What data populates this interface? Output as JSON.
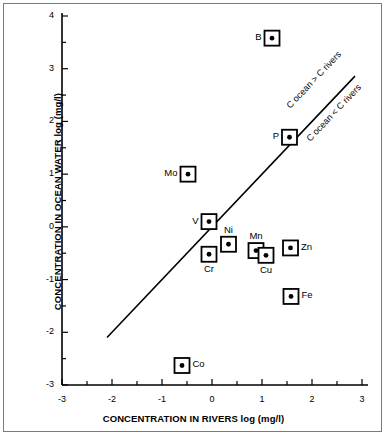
{
  "chart_data": {
    "type": "scatter",
    "title": "",
    "xlabel": "CONCENTRATION IN RIVERS log (mg/l)",
    "ylabel": "CONCENTRATION IN OCEAN WATER log (mg/l)",
    "xlim": [
      -3,
      3
    ],
    "ylim": [
      -3,
      4
    ],
    "xticks": [
      -3,
      -2,
      -1,
      0,
      1,
      2,
      3
    ],
    "yticks": [
      -3,
      -2,
      -1,
      0,
      1,
      2,
      3,
      4
    ],
    "xtick_labels": [
      "-3",
      "-2",
      "-1",
      "0",
      "1",
      "2",
      "3"
    ],
    "ytick_labels": [
      "-3",
      "-2",
      "-1",
      "0",
      "1",
      "2",
      "3",
      "4"
    ],
    "minor_tick_step": 0.5,
    "grid": false,
    "legend": "none",
    "marker_style": "open-square-with-filled-center-dot",
    "points": [
      {
        "label": "B",
        "x": 1.2,
        "y": 3.58,
        "label_side": "left"
      },
      {
        "label": "P",
        "x": 1.55,
        "y": 1.7,
        "label_side": "left"
      },
      {
        "label": "Mo",
        "x": -0.48,
        "y": 1.0,
        "label_side": "left"
      },
      {
        "label": "V",
        "x": -0.06,
        "y": 0.1,
        "label_side": "left"
      },
      {
        "label": "Ni",
        "x": 0.33,
        "y": -0.33,
        "label_side": "top"
      },
      {
        "label": "Cr",
        "x": -0.06,
        "y": -0.52,
        "label_side": "bottom"
      },
      {
        "label": "Mn",
        "x": 0.88,
        "y": -0.45,
        "label_side": "top"
      },
      {
        "label": "Cu",
        "x": 1.08,
        "y": -0.54,
        "label_side": "bottom"
      },
      {
        "label": "Zn",
        "x": 1.57,
        "y": -0.4,
        "label_side": "right"
      },
      {
        "label": "Fe",
        "x": 1.58,
        "y": -1.32,
        "label_side": "right"
      },
      {
        "label": "Co",
        "x": -0.6,
        "y": -2.63,
        "label_side": "right"
      }
    ],
    "reference_line": {
      "name": "one-to-one-line",
      "x_start": -2.1,
      "y_start": -2.1,
      "x_end": 2.86,
      "y_end": 2.86,
      "slope": 1,
      "intercept": 0
    },
    "annotations": [
      {
        "id": "above-line",
        "text": "C ocean > C rivers",
        "x": 1.52,
        "y": 2.25
      },
      {
        "id": "below-line",
        "text": "C ocean < C rivers",
        "x": 1.92,
        "y": 1.62
      }
    ],
    "colors": {
      "marker_edge": "#000000",
      "marker_face": "#ffffff",
      "marker_dot": "#000000",
      "axis": "#000000",
      "line": "#000000",
      "background": "#ffffff",
      "frame": "#7a7a7a"
    }
  }
}
